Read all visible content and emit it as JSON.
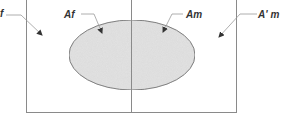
{
  "diagram": {
    "labels": {
      "outer_left": "f",
      "inner_left": "Af",
      "inner_right": "Am",
      "outer_right": "A' m"
    },
    "colors": {
      "line": "#8a8a8a",
      "ellipse_fill": "#e2e2e2",
      "ellipse_stroke": "#6e6e6e",
      "text": "#333333",
      "background": "#ffffff"
    }
  }
}
